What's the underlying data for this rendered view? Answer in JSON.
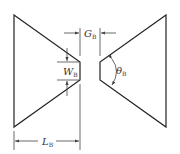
{
  "diagram": {
    "type": "bowtie-antenna-dimensions",
    "colors": {
      "stroke": "#222222",
      "dim": "#444444",
      "background": "#ffffff"
    },
    "labels": {
      "gap": {
        "main": "G",
        "sub": "B"
      },
      "width": {
        "main": "W",
        "sub": "B"
      },
      "angle": {
        "main": "θ",
        "sub": "B"
      },
      "length": {
        "main": "L",
        "sub": "B"
      }
    },
    "shapes": {
      "left_arm": "14,15 80,62 80,80 14,127",
      "right_arm": "166,15 100,62 100,80 166,127"
    }
  }
}
